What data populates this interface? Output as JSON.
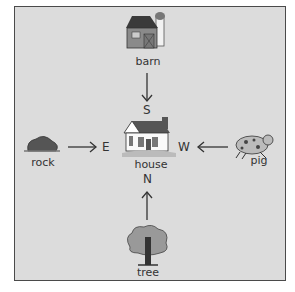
{
  "diagram": {
    "type": "compass-direction-map",
    "center": {
      "label": "house"
    },
    "directions": {
      "north": "N",
      "south": "S",
      "east": "E",
      "west": "W"
    },
    "items": [
      {
        "label": "barn",
        "position": "top",
        "arrow_points_to": "S"
      },
      {
        "label": "rock",
        "position": "left",
        "arrow_points_to": "E"
      },
      {
        "label": "pig",
        "position": "right",
        "arrow_points_to": "W"
      },
      {
        "label": "tree",
        "position": "bottom",
        "arrow_points_to": "N"
      }
    ]
  }
}
